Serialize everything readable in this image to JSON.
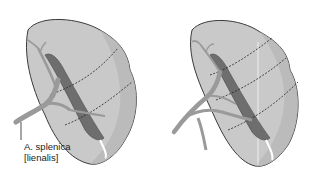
{
  "diagram": {
    "figures": [
      {
        "id": "left",
        "description": "Spleen with splenic artery branches and two dashed segment boundaries",
        "segment_lines": 2
      },
      {
        "id": "right",
        "description": "Spleen with splenic artery branches and three dashed segment boundaries plus vertical plane line",
        "segment_lines": 3
      }
    ],
    "labels": {
      "artery_line1": "A. splenica",
      "artery_line2": "[lienalis]"
    },
    "colors": {
      "organ_fill": "#c9c9c9",
      "organ_shade": "#b5b5b5",
      "outline": "#3a3a3a",
      "vessel": "#9a9a9a",
      "hilum": "#6e6e6e",
      "dashed": "#222222"
    }
  }
}
